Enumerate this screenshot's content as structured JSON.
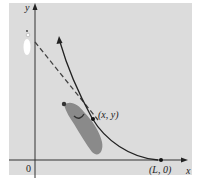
{
  "figure": {
    "panel_color": "#dcdcdc",
    "axis_color": "#333333",
    "curve_color": "#222222",
    "dog_color": "#8a8a8a",
    "dog_dark": "#555555",
    "person_color": "#ffffff",
    "labels": {
      "y_axis": "y",
      "x_axis": "x",
      "origin": "0",
      "point_xy": "(x, y)",
      "point_L0": "(L, 0)"
    }
  }
}
